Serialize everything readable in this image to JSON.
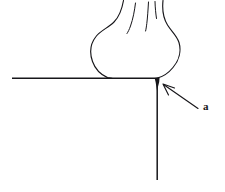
{
  "figure": {
    "background_color": "#ffffff",
    "ink_color": "#17161a",
    "width": 225,
    "height": 192,
    "caption_label": "a",
    "annotations": [
      {
        "name": "callout-a",
        "label": "a",
        "label_x": 203,
        "label_y": 107,
        "arrow_tail_x": 198,
        "arrow_tail_y": 108,
        "arrow_tip_x": 162,
        "arrow_tip_y": 84,
        "points_to": "corner-junction"
      }
    ],
    "parts": [
      {
        "name": "horizontal-rule",
        "from_x": 12,
        "from_y": 78,
        "to_x": 157,
        "to_y": 78
      },
      {
        "name": "vertical-rule",
        "from_x": 157,
        "from_y": 79,
        "to_x": 157,
        "to_y": 180
      },
      {
        "name": "bulb-outline",
        "description": "bulbous swelling resting on the horizontal rule"
      },
      {
        "name": "stalk-left-edge",
        "description": "left contour rising off the bulb to the top edge"
      },
      {
        "name": "stalk-right-edge",
        "description": "right contour rising off the bulb to the top edge"
      },
      {
        "name": "stalk-fold-inner-left",
        "description": "short interior fold line in the stalk"
      },
      {
        "name": "stalk-fold-inner-right",
        "description": "short interior fold line in the stalk"
      },
      {
        "name": "junction-mark",
        "description": "dark thickened mark at the corner where the rules meet",
        "x": 157,
        "y": 78
      }
    ]
  }
}
